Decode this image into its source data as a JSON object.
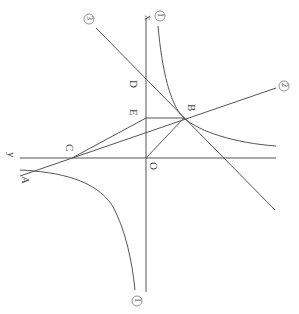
{
  "figure": {
    "axes": {
      "x_label": "x",
      "y_label": "y",
      "origin_label": "O"
    },
    "points": {
      "A": "A",
      "B": "B",
      "C": "C",
      "D": "D",
      "E": "E"
    },
    "curve_labels": {
      "hyperbola": "①",
      "line2": "②",
      "line3": "③"
    },
    "curve_label_numbers": {
      "hyperbola": "1",
      "line2": "2",
      "line3": "3"
    },
    "colors": {
      "line": "#555555",
      "background": "#ffffff"
    }
  }
}
